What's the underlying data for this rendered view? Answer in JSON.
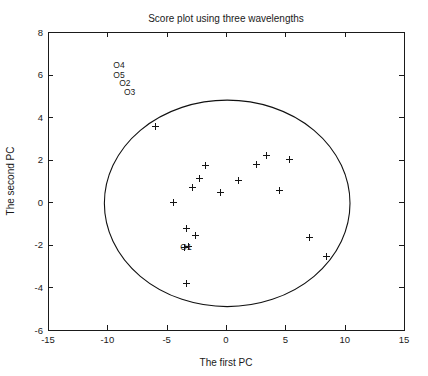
{
  "chart_data": {
    "type": "scatter",
    "title": "Score plot using three wavelengths",
    "xlabel": "The first PC",
    "ylabel": "The second PC",
    "xlim": [
      -15,
      15
    ],
    "ylim": [
      -6,
      8
    ],
    "xticks": [
      -15,
      -10,
      -5,
      0,
      5,
      10,
      15
    ],
    "yticks": [
      -6,
      -4,
      -2,
      0,
      2,
      4,
      6,
      8
    ],
    "xtick_labels": [
      "-15",
      "-10",
      "-5",
      "0",
      "5",
      "10",
      "15"
    ],
    "ytick_labels": [
      "-6",
      "-4",
      "-2",
      "0",
      "2",
      "4",
      "6",
      "8"
    ],
    "grid": false,
    "legend": null,
    "marker": "+",
    "marker_color": "#141414",
    "points": [
      {
        "x": -6.0,
        "y": 3.6
      },
      {
        "x": -4.5,
        "y": 0.0
      },
      {
        "x": -2.9,
        "y": 0.7
      },
      {
        "x": -2.3,
        "y": 1.15
      },
      {
        "x": -1.8,
        "y": 1.75
      },
      {
        "x": -0.5,
        "y": 0.5
      },
      {
        "x": 1.0,
        "y": 1.05
      },
      {
        "x": 2.5,
        "y": 1.8
      },
      {
        "x": 3.4,
        "y": 2.2
      },
      {
        "x": 5.3,
        "y": 2.05
      },
      {
        "x": 4.5,
        "y": 0.6
      },
      {
        "x": -3.4,
        "y": -1.2
      },
      {
        "x": -2.6,
        "y": -1.55
      },
      {
        "x": -3.5,
        "y": -2.1
      },
      {
        "x": -3.2,
        "y": -2.05
      },
      {
        "x": -3.4,
        "y": -3.8
      },
      {
        "x": 7.0,
        "y": -1.65
      },
      {
        "x": 8.4,
        "y": -2.5
      }
    ],
    "outlier_labels": [
      {
        "text": "O4",
        "x": -9.5,
        "y": 6.45
      },
      {
        "text": "O5",
        "x": -9.5,
        "y": 6.0
      },
      {
        "text": "O2",
        "x": -9.0,
        "y": 5.6
      },
      {
        "text": "O3",
        "x": -8.6,
        "y": 5.2
      },
      {
        "text": "O1",
        "x": -3.85,
        "y": -2.1
      }
    ],
    "ellipse": {
      "center_x": 0.1,
      "center_y": -0.05,
      "radius_x": 10.35,
      "radius_y": 4.85,
      "stroke": "#111111"
    },
    "axis_color": "#1a1a1a",
    "background": "#ffffff"
  }
}
